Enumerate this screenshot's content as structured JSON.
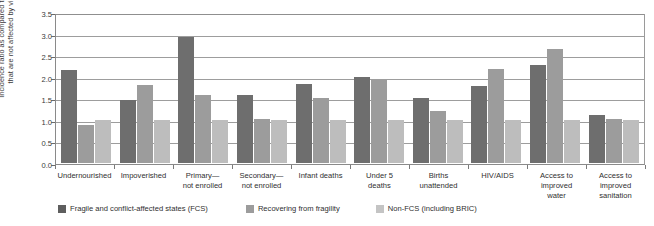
{
  "chart_data": {
    "type": "bar",
    "title": "",
    "subtitle": "",
    "xlabel": "",
    "ylabel": "Incidence ratio as compared to countries that are not affected by violence",
    "ylabel_line1": "Incidence ratio as compared to countries",
    "ylabel_line2": "that are not affected by violence",
    "ylim": [
      0,
      3.5
    ],
    "ytick_labels": [
      "3.5",
      "3.0",
      "2.5",
      "2.0",
      "1.5",
      "1.0",
      "0.5",
      "0.0"
    ],
    "ytick_values": [
      3.5,
      3.0,
      2.5,
      2.0,
      1.5,
      1.0,
      0.5,
      0.0
    ],
    "grid": true,
    "legend_position": "bottom",
    "categories": [
      "Undernourished",
      "Impoverished",
      "Primary—\nnot enrolled",
      "Secondary—\nnot enrolled",
      "Infant deaths",
      "Under 5\ndeaths",
      "Births\nunattended",
      "HIV/AIDS",
      "Access to\nimproved\nwater",
      "Access to\nimproved\nsanitation"
    ],
    "series": [
      {
        "name": "Fragile and conflict-affected states (FCS)",
        "color": "#6e6e6e",
        "values": [
          2.15,
          1.45,
          2.92,
          1.57,
          1.82,
          2.0,
          1.51,
          1.78,
          2.28,
          1.12
        ]
      },
      {
        "name": "Recovering from fragility",
        "color": "#9c9c9c",
        "values": [
          0.88,
          1.8,
          1.57,
          1.02,
          1.5,
          1.93,
          1.2,
          2.17,
          2.65,
          1.03
        ]
      },
      {
        "name": "Non-FCS (including BRIC)",
        "color": "#bdbdbd",
        "values": [
          1.0,
          1.0,
          1.0,
          1.0,
          1.0,
          1.0,
          1.0,
          1.0,
          1.0,
          1.0
        ]
      }
    ]
  }
}
